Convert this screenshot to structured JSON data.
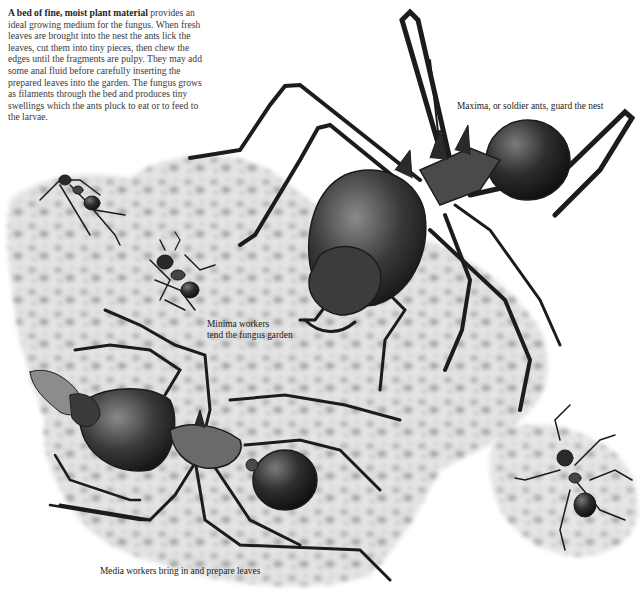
{
  "intro": {
    "lead": "A bed of fine, moist plant material",
    "body": " provides an ideal growing medium for the fungus. When fresh leaves are brought into the nest the ants lick the leaves, cut them into tiny pieces, then chew the edges until the fragments are pulpy. They may add some anal fluid before carefully inserting the prepared leaves into the garden. The fungus grows as filaments through the bed and produces tiny swellings which the ants pluck to eat or to feed to the larvae."
  },
  "captions": {
    "maxima": "Maxima, or soldier ants, guard the nest",
    "minima_line1": "Minima workers",
    "minima_line2": "tend the fungus garden",
    "media": "Media workers bring in and prepare leaves"
  },
  "illustration": {
    "subjects": [
      "maxima-soldier-ant",
      "media-worker-ant",
      "minima-worker-ant",
      "small-worker-ant-left",
      "small-worker-ant-right",
      "fungus-garden-bed",
      "leaf-fragment"
    ],
    "colors": {
      "ink": "#1c1c1c",
      "body_dark": "#2b2b2b",
      "body_mid": "#555555",
      "fungus_light": "#e4e4e4",
      "fungus_spot": "#9a9a9a"
    }
  }
}
